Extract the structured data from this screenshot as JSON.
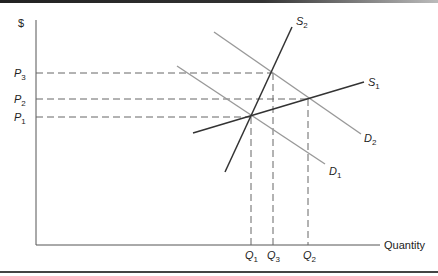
{
  "diagram": {
    "y_axis_label": "$",
    "x_axis_label": "Quantity",
    "price_levels": [
      {
        "name": "P",
        "sub": "3",
        "y": 73
      },
      {
        "name": "P",
        "sub": "2",
        "y": 99
      },
      {
        "name": "P",
        "sub": "1",
        "y": 117
      }
    ],
    "quantity_levels": [
      {
        "name": "Q",
        "sub": "1",
        "x": 251
      },
      {
        "name": "Q",
        "sub": "3",
        "x": 273
      },
      {
        "name": "Q",
        "sub": "2",
        "x": 308
      }
    ],
    "curves": [
      {
        "name": "S",
        "sub": "2",
        "kind": "supply",
        "color": "#333333",
        "from": [
          225,
          172
        ],
        "to": [
          292,
          27
        ]
      },
      {
        "name": "S",
        "sub": "1",
        "kind": "supply",
        "color": "#333333",
        "from": [
          193,
          133
        ],
        "to": [
          364,
          82
        ]
      },
      {
        "name": "D",
        "sub": "2",
        "kind": "demand",
        "color": "#999999",
        "from": [
          214,
          32
        ],
        "to": [
          361,
          134
        ]
      },
      {
        "name": "D",
        "sub": "1",
        "kind": "demand",
        "color": "#999999",
        "from": [
          177,
          66
        ],
        "to": [
          325,
          164
        ]
      }
    ],
    "equilibria": [
      {
        "label": "S1-D1",
        "price": "P1",
        "quantity": "Q1"
      },
      {
        "label": "S2-D2",
        "price": "P3",
        "quantity": "Q3"
      },
      {
        "label": "S1-D2",
        "price": "P2",
        "quantity": "Q2"
      }
    ]
  }
}
